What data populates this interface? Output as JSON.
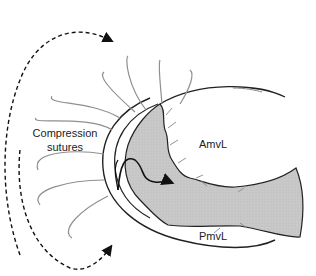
{
  "figure": {
    "type": "anatomical diagram",
    "labels": {
      "compression_line1": "Compression",
      "compression_line2": "sutures",
      "anterior_leaflet": "AmvL",
      "posterior_leaflet": "PmvL"
    },
    "colors": {
      "background": "#ffffff",
      "outline": "#1a1a1a",
      "suture": "#8a8a8a",
      "tissue_fill": "#c8c8c8",
      "arrow": "#111111"
    },
    "elements": {
      "suture_count": 9,
      "dashed_arrows": [
        "top arc arrow",
        "bottom arc arrow"
      ]
    }
  }
}
